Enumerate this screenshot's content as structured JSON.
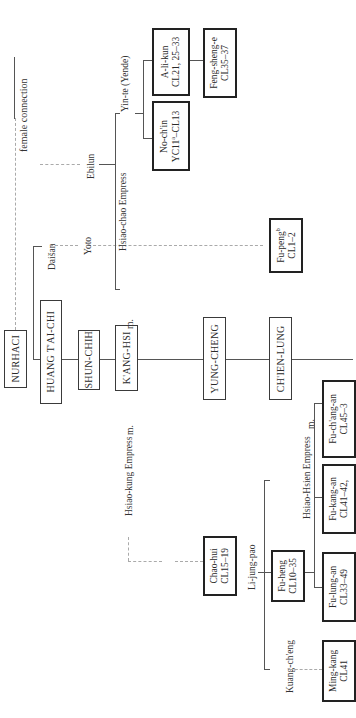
{
  "diagram": {
    "type": "genealogy",
    "orientation": "rotated-90-ccw",
    "emperors": [
      {
        "name": "NURHACI"
      },
      {
        "name": "HUANG T'AI-CHI"
      },
      {
        "name": "SHUN-CHIH"
      },
      {
        "name": "K'ANG-HSI"
      },
      {
        "name": "YUNG-CHENG"
      },
      {
        "name": "CH'IEN-LUNG"
      }
    ],
    "nurhaci_branch": {
      "female_connection_label": "female connection",
      "daisan": "Daišan",
      "yoto": "Yoto",
      "ebilun": "Ebilun",
      "yinte": "Yin-te (Yende)",
      "hsiao_chao": "Hsiao-chao Empress",
      "marriage_label": "m."
    },
    "people": {
      "no_chin": {
        "name": "No-ch'in",
        "dates": "YC11",
        "sup": "a",
        "dates_end": "–CL13"
      },
      "a_li_kun": {
        "name": "A-li-kun",
        "dates": "CL21, 25–33"
      },
      "feng_sheng_e": {
        "name": "Feng-sheng-e",
        "dates": "CL35–37"
      },
      "fu_peng": {
        "name": "Fu-peng",
        "sup": "b",
        "dates": "CL1–2"
      },
      "chao_hui": {
        "name": "Chao-hui",
        "dates": "CL15–19"
      },
      "fu_heng": {
        "name": "Fu-heng",
        "dates": "CL10–35"
      },
      "ming_kang": {
        "name": "Ming-kang",
        "dates": "CL41"
      },
      "fu_lung_an": {
        "name": "Fu-lung-an",
        "dates": "CL33–49"
      },
      "fu_kang_an": {
        "name": "Fu-kang-an",
        "dates": "CL41–42,"
      },
      "fu_chang_an": {
        "name": "Fu-ch'ang-an",
        "dates": "CL45–3"
      }
    },
    "lower_branch": {
      "hsiao_kung": "Hsiao-kung Empress",
      "marriage_label": "m.",
      "li_jung_pao": "Li-jung-pao",
      "kuang_cheng": "Kuang-ch'eng",
      "hsiao_hsien": "Hsiao-Hsien Empress",
      "marriage_label_2": "m."
    }
  }
}
